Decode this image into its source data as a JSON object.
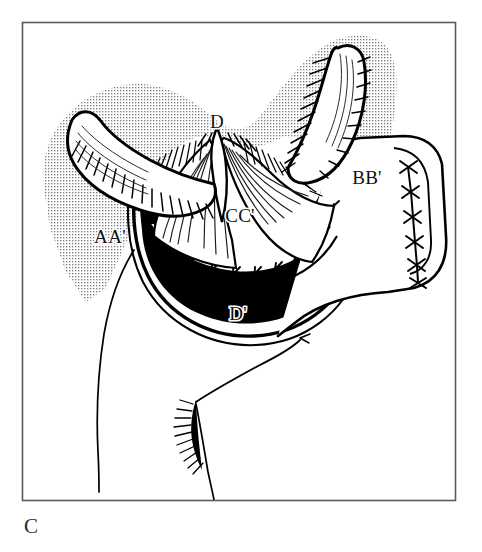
{
  "figure": {
    "caption": "C",
    "frame": {
      "stroke_color": "#5a5a5a",
      "x": 22,
      "y": 22,
      "width": 433,
      "height": 478
    },
    "background_color": "#ffffff",
    "ink_color": "#000000",
    "stipple_color": "#8a8a8a",
    "cavity_fill": "#000000"
  },
  "labels": [
    {
      "id": "label-d",
      "text": "D",
      "x": 217,
      "y": 124
    },
    {
      "id": "label-aa",
      "text": "AA'",
      "x": 110,
      "y": 239
    },
    {
      "id": "label-bb",
      "text": "BB'",
      "x": 367,
      "y": 180
    },
    {
      "id": "label-cc",
      "text": "CC'",
      "x": 240,
      "y": 218
    },
    {
      "id": "label-dp",
      "text": "D'",
      "x": 238,
      "y": 316
    }
  ],
  "regions": {
    "stipple_field": {
      "name": "shaded-tissue-field",
      "pattern": "halftone-dots"
    },
    "left_horn": {
      "name": "left-tubular-structure"
    },
    "right_horn": {
      "name": "right-tubular-structure"
    },
    "cavity": {
      "name": "open-cavity-lumen"
    },
    "right_flap": {
      "name": "sutured-tissue-flap",
      "suture_count": 6
    },
    "anterior_suture_line": {
      "name": "running-suture-line",
      "stitch_count": 11
    },
    "body_outline": {
      "name": "lower-body-contour"
    }
  }
}
